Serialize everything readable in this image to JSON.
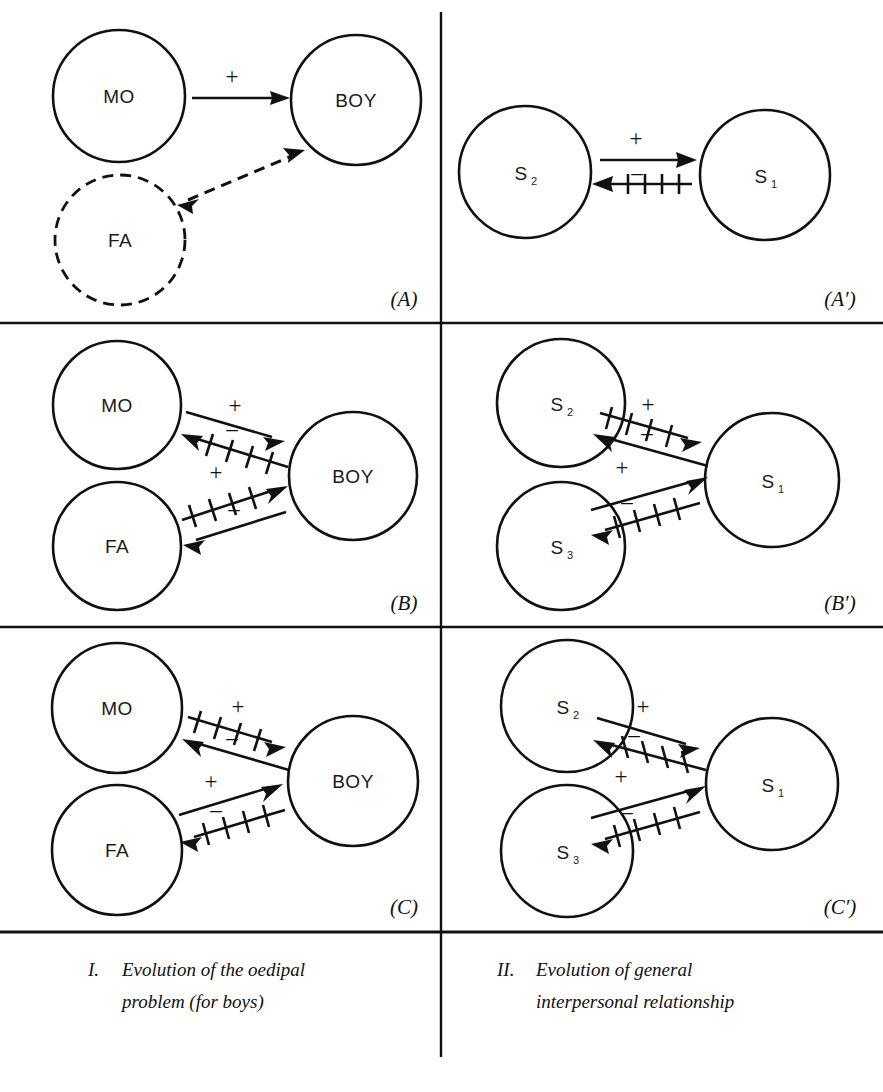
{
  "figure": {
    "title_columns": [
      {
        "num": "I.",
        "lines": [
          "Evolution of the oedipal",
          "problem (for boys)"
        ]
      },
      {
        "num": "II.",
        "lines": [
          "Evolution of general",
          "interpersonal relationship"
        ]
      }
    ],
    "panels": [
      {
        "id": "(A)",
        "column": "left",
        "nodes": [
          {
            "name": "MO",
            "sub": "",
            "style": "solid"
          },
          {
            "name": "BOY",
            "sub": "",
            "style": "solid"
          },
          {
            "name": "FA",
            "sub": "",
            "style": "dashed"
          }
        ],
        "links": [
          {
            "from": "MO",
            "to": "BOY",
            "sign": "+",
            "hatched": false,
            "style": "solid"
          },
          {
            "from": "FA",
            "to": "BOY",
            "sign": "",
            "hatched": false,
            "style": "dashed-double"
          }
        ]
      },
      {
        "id": "(A')",
        "column": "right",
        "nodes": [
          {
            "name": "S",
            "sub": "2",
            "style": "solid"
          },
          {
            "name": "S",
            "sub": "1",
            "style": "solid"
          }
        ],
        "links": [
          {
            "from": "S2",
            "to": "S1",
            "sign": "+",
            "hatched": false,
            "style": "solid"
          },
          {
            "from": "S1",
            "to": "S2",
            "sign": "–",
            "hatched": true,
            "style": "solid"
          }
        ]
      },
      {
        "id": "(B)",
        "column": "left",
        "nodes": [
          {
            "name": "MO",
            "sub": "",
            "style": "solid"
          },
          {
            "name": "FA",
            "sub": "",
            "style": "solid"
          },
          {
            "name": "BOY",
            "sub": "",
            "style": "solid"
          }
        ],
        "links": [
          {
            "from": "MO",
            "to": "BOY",
            "sign": "+",
            "hatched": false,
            "style": "solid"
          },
          {
            "from": "BOY",
            "to": "MO",
            "sign": "–",
            "hatched": true,
            "style": "solid"
          },
          {
            "from": "FA",
            "to": "BOY",
            "sign": "+",
            "hatched": true,
            "style": "solid"
          },
          {
            "from": "BOY",
            "to": "FA",
            "sign": "–",
            "hatched": false,
            "style": "solid"
          }
        ]
      },
      {
        "id": "(B')",
        "column": "right",
        "nodes": [
          {
            "name": "S",
            "sub": "2",
            "style": "solid"
          },
          {
            "name": "S",
            "sub": "3",
            "style": "solid"
          },
          {
            "name": "S",
            "sub": "1",
            "style": "solid"
          }
        ],
        "links": [
          {
            "from": "S2",
            "to": "S1",
            "sign": "+",
            "hatched": true,
            "style": "solid"
          },
          {
            "from": "S1",
            "to": "S2",
            "sign": "–",
            "hatched": false,
            "style": "solid"
          },
          {
            "from": "S3",
            "to": "S1",
            "sign": "+",
            "hatched": false,
            "style": "solid"
          },
          {
            "from": "S1",
            "to": "S3",
            "sign": "–",
            "hatched": true,
            "style": "solid"
          }
        ]
      },
      {
        "id": "(C)",
        "column": "left",
        "nodes": [
          {
            "name": "MO",
            "sub": "",
            "style": "solid"
          },
          {
            "name": "FA",
            "sub": "",
            "style": "solid"
          },
          {
            "name": "BOY",
            "sub": "",
            "style": "solid"
          }
        ],
        "links": [
          {
            "from": "MO",
            "to": "BOY",
            "sign": "+",
            "hatched": true,
            "style": "solid"
          },
          {
            "from": "BOY",
            "to": "MO",
            "sign": "–",
            "hatched": false,
            "style": "solid"
          },
          {
            "from": "FA",
            "to": "BOY",
            "sign": "+",
            "hatched": false,
            "style": "solid"
          },
          {
            "from": "BOY",
            "to": "FA",
            "sign": "–",
            "hatched": true,
            "style": "solid"
          }
        ]
      },
      {
        "id": "(C')",
        "column": "right",
        "nodes": [
          {
            "name": "S",
            "sub": "2",
            "style": "solid"
          },
          {
            "name": "S",
            "sub": "3",
            "style": "solid"
          },
          {
            "name": "S",
            "sub": "1",
            "style": "solid"
          }
        ],
        "links": [
          {
            "from": "S2",
            "to": "S1",
            "sign": "+",
            "hatched": false,
            "style": "solid"
          },
          {
            "from": "S1",
            "to": "S2",
            "sign": "–",
            "hatched": true,
            "style": "solid"
          },
          {
            "from": "S3",
            "to": "S1",
            "sign": "+",
            "hatched": false,
            "style": "solid"
          },
          {
            "from": "S1",
            "to": "S3",
            "sign": "–",
            "hatched": true,
            "style": "solid"
          }
        ]
      }
    ],
    "colors": {
      "ink": "#111111",
      "paper": "#ffffff"
    }
  },
  "labels": {
    "MO": "MO",
    "FA": "FA",
    "BOY": "BOY",
    "S": "S",
    "sub1": "1",
    "sub2": "2",
    "sub3": "3",
    "plus": "+",
    "minus": "–",
    "panel_a": "(A)",
    "panel_a_prime": "(A′)",
    "panel_b": "(B)",
    "panel_b_prime": "(B′)",
    "panel_c": "(C)",
    "panel_c_prime": "(C′)",
    "cap1_num": "I.",
    "cap1_l1": "Evolution of the oedipal",
    "cap1_l2": "problem (for boys)",
    "cap2_num": "II.",
    "cap2_l1": "Evolution of general",
    "cap2_l2": "interpersonal relationship"
  }
}
